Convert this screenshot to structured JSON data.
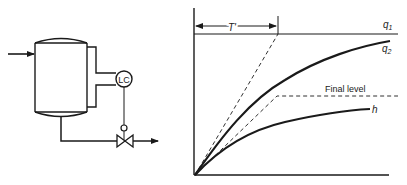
{
  "figure": {
    "process_diagram": {
      "controller_label": "LC",
      "components": [
        "inlet-stream",
        "tank",
        "level-gauge",
        "level-controller",
        "control-valve",
        "outlet-stream"
      ]
    },
    "response_plot": {
      "labels": {
        "time_constant": "T'",
        "q1": "q",
        "q1_sub": "1",
        "q2": "q",
        "q2_sub": "2",
        "final_level": "Final level",
        "h": "h"
      },
      "colors": {
        "ink": "#1a1a1a",
        "background": "#ffffff"
      }
    }
  }
}
